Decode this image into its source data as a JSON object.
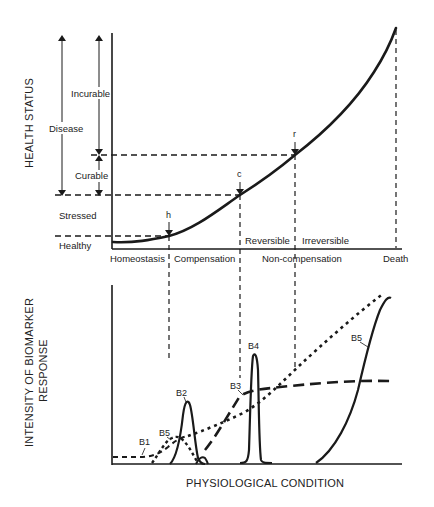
{
  "figure": {
    "top_panel": {
      "y_axis_title": "HEALTH STATUS",
      "range_labels": {
        "disease": "Disease",
        "incurable": "Incurable",
        "curable": "Curable",
        "stressed": "Stressed",
        "healthy": "Healthy"
      },
      "point_labels": {
        "h": "h",
        "c": "c",
        "r": "r"
      },
      "x_phase_labels": [
        "Homeostasis",
        "Compensation",
        "Non-compensation",
        "Death"
      ],
      "reversibility_labels": {
        "reversible": "Reversible",
        "irreversible": "Irreversible"
      }
    },
    "bottom_panel": {
      "y_axis_title_line1": "INTENSITY OF BIOMARKER",
      "y_axis_title_line2": "RESPONSE",
      "x_axis_title": "PHYSIOLOGICAL CONDITION",
      "biomarker_labels": {
        "b1": "B1",
        "b2": "B2",
        "b3": "B3",
        "b4": "B4",
        "b5_early": "B5",
        "b5_late": "B5"
      }
    },
    "colors": {
      "ink": "#1a1a1a",
      "background": "#ffffff"
    }
  }
}
